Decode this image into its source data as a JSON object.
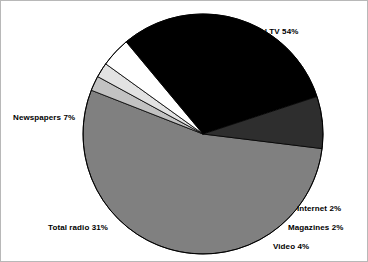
{
  "chart_data": {
    "type": "pie",
    "title": "",
    "subtitle": "",
    "xlabel": "",
    "ylabel": "",
    "legend_position": "none",
    "grid": false,
    "categories": [
      "Total TV",
      "Internet",
      "Magazines",
      "Video",
      "Total radio",
      "Newspapers"
    ],
    "values": [
      54,
      2,
      2,
      4,
      31,
      7
    ],
    "unit": "%",
    "slices": [
      {
        "name": "Total TV",
        "value": 54,
        "label": "Total TV 54%",
        "color": "#808080",
        "start_angle": 97,
        "end_angle": 291.4
      },
      {
        "name": "Internet",
        "value": 2,
        "label": "Internet 2%",
        "color": "#c2c2c2",
        "start_angle": 291.4,
        "end_angle": 298.6
      },
      {
        "name": "Magazines",
        "value": 2,
        "label": "Magazines 2%",
        "color": "#e2e2e2",
        "start_angle": 298.6,
        "end_angle": 305.8
      },
      {
        "name": "Video",
        "value": 4,
        "label": "Video 4%",
        "color": "#ffffff",
        "start_angle": 305.8,
        "end_angle": 320.2
      },
      {
        "name": "Total radio",
        "value": 31,
        "label": "Total radio 31%",
        "color": "#000000",
        "start_angle": 320.2,
        "end_angle": 431.8
      },
      {
        "name": "Newspapers",
        "value": 7,
        "label": "Newspapers 7%",
        "color": "#2e2e2e",
        "start_angle": 431.8,
        "end_angle": 457.0
      }
    ],
    "geometry": {
      "center_x": 202,
      "center_y": 133,
      "radius": 120
    },
    "outline_color": "#000000",
    "background": "#ffffff"
  }
}
